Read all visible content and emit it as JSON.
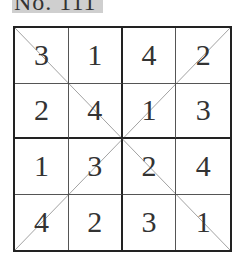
{
  "title": "No. 111",
  "puzzle": {
    "size": 4,
    "rows": [
      [
        "3",
        "1",
        "4",
        "2"
      ],
      [
        "2",
        "4",
        "1",
        "3"
      ],
      [
        "1",
        "3",
        "2",
        "4"
      ],
      [
        "4",
        "2",
        "3",
        "1"
      ]
    ],
    "diagonals": true
  }
}
